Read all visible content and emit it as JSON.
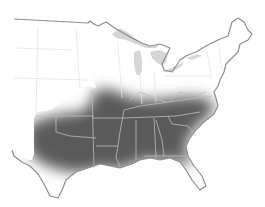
{
  "map": {
    "type": "range-map",
    "region": "Eastern United States",
    "colors": {
      "background": "#ffffff",
      "land": "#ffffff",
      "outline": "#8e8e8e",
      "state_border": "#e4e4e4",
      "state_border_in_range": "#bdbdbd",
      "water": "#d6d6d6",
      "range": "#5a5a5a"
    },
    "range": {
      "description": "Shaded distribution area covering the southeastern and south-central states",
      "states": [
        "Texas (east)",
        "Oklahoma",
        "Kansas (southeast)",
        "Missouri",
        "Illinois (south)",
        "Indiana (south)",
        "Kentucky",
        "Tennessee",
        "Arkansas",
        "Louisiana",
        "Mississippi",
        "Alabama",
        "Georgia",
        "South Carolina",
        "North Carolina",
        "Virginia",
        "West Virginia (south)",
        "Florida (north)"
      ]
    }
  }
}
